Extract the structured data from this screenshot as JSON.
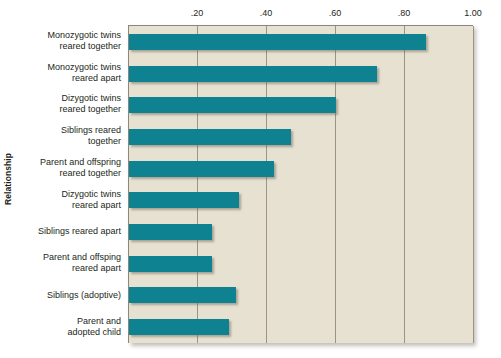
{
  "chart_data": {
    "type": "bar",
    "orientation": "horizontal",
    "title": "",
    "xlabel": "",
    "ylabel": "Relationship",
    "xlim": [
      0,
      1.0
    ],
    "ylim": null,
    "grid": true,
    "legend": false,
    "xticks": [
      {
        "value": 0.2,
        "label": ".20"
      },
      {
        "value": 0.4,
        "label": ".40"
      },
      {
        "value": 0.6,
        "label": ".60"
      },
      {
        "value": 0.8,
        "label": ".80"
      },
      {
        "value": 1.0,
        "label": "1.00"
      }
    ],
    "categories": [
      "Monozygotic twins reared together",
      "Monozygotic twins reared apart",
      "Dizygotic twins reared together",
      "Siblings reared together",
      "Parent and offspring reared together",
      "Dizygotic twins reared apart",
      "Siblings reared apart",
      "Parent and offsping reared apart",
      "Siblings (adoptive)",
      "Parent and adopted child"
    ],
    "category_lines": [
      [
        "Monozygotic twins",
        "reared together"
      ],
      [
        "Monozygotic twins",
        "reared apart"
      ],
      [
        "Dizygotic twins",
        "reared together"
      ],
      [
        "Siblings reared",
        "together"
      ],
      [
        "Parent and offspring",
        "reared together"
      ],
      [
        "Dizygotic twins",
        "reared apart"
      ],
      [
        "Siblings reared apart"
      ],
      [
        "Parent and offsping",
        "reared apart"
      ],
      [
        "Siblings (adoptive)"
      ],
      [
        "Parent and",
        "adopted child"
      ]
    ],
    "values": [
      0.86,
      0.72,
      0.6,
      0.47,
      0.42,
      0.32,
      0.24,
      0.24,
      0.31,
      0.29
    ],
    "bar_color": "#0e8291",
    "plot_background": "#e7e1d2",
    "grid_color": "#9a9386",
    "axis_color": "#8d867a"
  }
}
